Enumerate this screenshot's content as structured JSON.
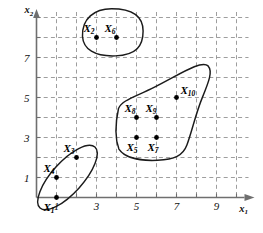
{
  "chart_data": {
    "type": "scatter",
    "title": "",
    "xlabel": "x1",
    "ylabel": "x2",
    "xlim": [
      0,
      10.6
    ],
    "ylim": [
      -0.6,
      9.8
    ],
    "grid": true,
    "legend": false,
    "x_ticks": [
      1,
      3,
      5,
      7,
      9
    ],
    "x_tick_labels": [
      "1",
      "3",
      "5",
      "7",
      "9"
    ],
    "y_ticks": [
      1,
      3,
      5,
      7
    ],
    "y_tick_labels": [
      "1",
      "3",
      "5",
      "7"
    ],
    "points": [
      {
        "id": "X1",
        "label": "X",
        "sub": "1",
        "x": 1,
        "y": 0,
        "label_dx": -13,
        "label_dy": 13
      },
      {
        "id": "X2",
        "label": "X",
        "sub": "2",
        "x": 3,
        "y": 8,
        "label_dx": -13,
        "label_dy": -6
      },
      {
        "id": "X3",
        "label": "X",
        "sub": "3",
        "x": 2,
        "y": 2,
        "label_dx": -13,
        "label_dy": -6
      },
      {
        "id": "X4",
        "label": "X",
        "sub": "4",
        "x": 1,
        "y": 1,
        "label_dx": -13,
        "label_dy": -6
      },
      {
        "id": "X5",
        "label": "X",
        "sub": "5",
        "x": 5,
        "y": 3,
        "label_dx": -10,
        "label_dy": 13
      },
      {
        "id": "X6",
        "label": "X",
        "sub": "6",
        "x": 4,
        "y": 8,
        "label_dx": -12,
        "label_dy": -6
      },
      {
        "id": "X7",
        "label": "X",
        "sub": "7",
        "x": 6,
        "y": 3,
        "label_dx": -9,
        "label_dy": 13
      },
      {
        "id": "X8",
        "label": "X",
        "sub": "8",
        "x": 5,
        "y": 4,
        "label_dx": -12,
        "label_dy": -6
      },
      {
        "id": "X9",
        "label": "X",
        "sub": "9",
        "x": 6,
        "y": 4,
        "label_dx": -11,
        "label_dy": -6
      },
      {
        "id": "X10",
        "label": "X",
        "sub": "10",
        "x": 7,
        "y": 5,
        "label_dx": 4,
        "label_dy": -4
      }
    ],
    "clusters": [
      {
        "name": "cluster-lower-left",
        "members": [
          "X1",
          "X4",
          "X3"
        ],
        "shape": "ellipse",
        "cx": 1.55,
        "cy": 1.0,
        "rx": 2.05,
        "ry": 0.78,
        "rotation": 48
      },
      {
        "name": "cluster-upper",
        "members": [
          "X2",
          "X6"
        ],
        "shape": "blob",
        "path": "M 2.30 8.05 C 2.26 8.95, 2.90 9.44, 3.75 9.44 C 4.72 9.44, 5.33 9.12, 5.33 8.32 C 5.33 7.58, 5.00 7.12, 3.95 7.08 C 2.90 7.04, 2.34 7.42, 2.30 8.05 Z"
      },
      {
        "name": "cluster-right",
        "members": [
          "X5",
          "X7",
          "X8",
          "X9",
          "X10"
        ],
        "shape": "blob",
        "path": "M 4.10 4.45 C 3.92 3.62, 3.94 2.92, 4.12 2.42 C 4.42 1.98, 5.20 1.82, 6.05 1.86 C 6.90 1.90, 7.32 2.08, 7.52 2.62 C 7.78 3.32, 7.96 4.20, 8.30 5.02 C 8.62 5.80, 8.82 6.32, 8.58 6.58 C 8.24 6.90, 7.10 6.12, 5.90 5.52 C 4.90 5.02, 4.26 4.86, 4.10 4.45 Z"
      }
    ]
  }
}
